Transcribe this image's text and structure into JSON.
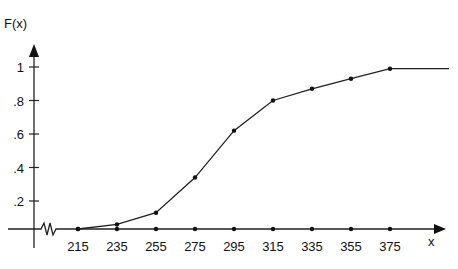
{
  "chart_data": {
    "type": "line",
    "title": "",
    "ylabel": "F(x)",
    "xlabel": "x",
    "x": [
      215,
      235,
      255,
      275,
      295,
      315,
      335,
      355,
      375
    ],
    "series": [
      {
        "name": "F(x)",
        "values": [
          0.0,
          0.06,
          0.13,
          0.34,
          0.62,
          0.8,
          0.87,
          0.93,
          0.99
        ]
      }
    ],
    "x_ticks": [
      "215",
      "235",
      "255",
      "275",
      "295",
      "315",
      "335",
      "355",
      "375"
    ],
    "y_ticks": [
      ".2",
      ".4",
      ".6",
      ".8",
      "1"
    ],
    "ylim": [
      0,
      1
    ],
    "axis_break": true,
    "grid": false,
    "legend": "none",
    "tail_after_last": 1.0
  }
}
